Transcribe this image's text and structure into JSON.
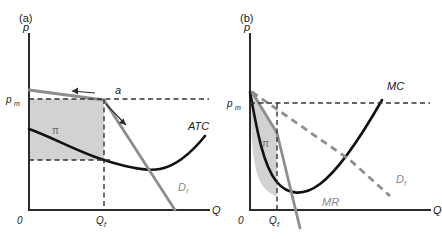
{
  "figure": {
    "panels": [
      {
        "id": "a",
        "label": "(a)",
        "y_axis_label": "p",
        "x_axis_label": "Q",
        "origin_label": "0",
        "price_tick": "p",
        "price_tick_sub": "m",
        "quantity_tick": "Q",
        "quantity_tick_sub": "f",
        "profit_symbol": "π",
        "point_label": "a",
        "curves": [
          {
            "name": "ATC",
            "label": "ATC",
            "style": "solid-black"
          },
          {
            "name": "firm-demand",
            "label": "D",
            "label_sub": "f",
            "style": "solid-gray"
          }
        ]
      },
      {
        "id": "b",
        "label": "(b)",
        "y_axis_label": "p",
        "x_axis_label": "Q",
        "origin_label": "0",
        "price_tick": "p",
        "price_tick_sub": "m",
        "quantity_tick": "Q",
        "quantity_tick_sub": "f",
        "profit_symbol": "π",
        "curves": [
          {
            "name": "marginal-cost",
            "label": "MC",
            "style": "solid-black"
          },
          {
            "name": "firm-demand",
            "label": "D",
            "label_sub": "f",
            "style": "dashed-gray"
          },
          {
            "name": "marginal-revenue",
            "label": "MR",
            "style": "solid-gray"
          }
        ]
      }
    ],
    "colors": {
      "curve_black": "#111111",
      "curve_gray": "#8e8e8e",
      "region_fill": "#d2d2d2",
      "axis": "#2b2b2b",
      "dashed_guide": "#333333"
    }
  }
}
